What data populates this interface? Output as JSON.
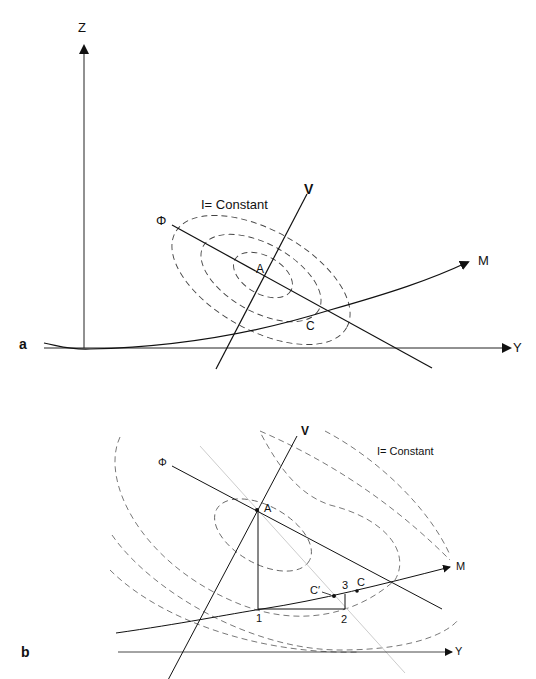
{
  "panel_a": {
    "panel_label": "a",
    "axis_z": "Z",
    "axis_y": "Y",
    "line_v": "V",
    "line_phi": "Φ",
    "curve_m": "M",
    "contour_label": "I= Constant",
    "point_a": "A",
    "point_c": "C"
  },
  "panel_b": {
    "panel_label": "b",
    "axis_y": "Y",
    "line_v": "V",
    "line_phi": "Φ",
    "curve_m": "M",
    "contour_label": "I= Constant",
    "point_a": "A",
    "point_c": "C",
    "point_c_prime": "C′",
    "step_1": "1",
    "step_2": "2",
    "step_3": "3"
  }
}
